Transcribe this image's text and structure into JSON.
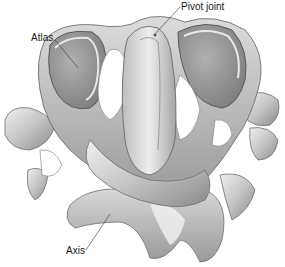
{
  "figure": {
    "labels": {
      "atlas": "Atlas",
      "pivot_joint": "Pivot joint",
      "axis": "Axis"
    },
    "colors": {
      "background": "#ffffff",
      "bone_light": "#e6e6e6",
      "bone_mid": "#b8b8b8",
      "bone_dark": "#7a7a7a",
      "leader_line": "#333333",
      "text": "#1a1a1a"
    }
  }
}
